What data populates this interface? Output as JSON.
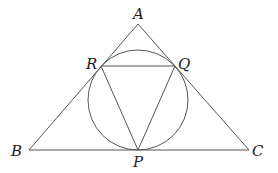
{
  "diagram": {
    "type": "geometry",
    "stroke_color": "#555555",
    "label_color": "#222222",
    "points": {
      "A": {
        "label": "A",
        "x": 138,
        "y": 24
      },
      "B": {
        "label": "B",
        "x": 29,
        "y": 150
      },
      "C": {
        "label": "C",
        "x": 249,
        "y": 150
      },
      "P": {
        "label": "P",
        "x": 138,
        "y": 150
      },
      "Q": {
        "label": "Q",
        "x": 175,
        "y": 66
      },
      "R": {
        "label": "R",
        "x": 101,
        "y": 66
      }
    },
    "circle": {
      "cx": 138,
      "cy": 100,
      "r": 50
    },
    "segments": [
      [
        "A",
        "B"
      ],
      [
        "B",
        "C"
      ],
      [
        "C",
        "A"
      ],
      [
        "P",
        "Q"
      ],
      [
        "Q",
        "R"
      ],
      [
        "R",
        "P"
      ]
    ],
    "labels": {
      "A": "A",
      "B": "B",
      "C": "C",
      "P": "P",
      "Q": "Q",
      "R": "R"
    }
  }
}
